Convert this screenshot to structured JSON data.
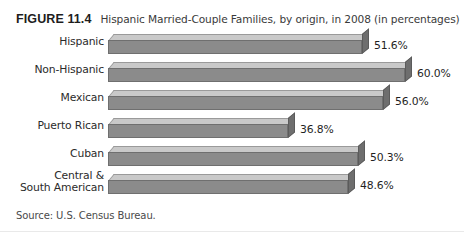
{
  "figure": {
    "number_label": "FIGURE 11.4",
    "title": "Hispanic Married-Couple Families, by origin, in 2008 (in percentages)",
    "source": "Source: U.S. Census Bureau."
  },
  "chart_data": {
    "type": "bar",
    "orientation": "horizontal",
    "style": "3d",
    "title": "Hispanic Married-Couple Families, by origin, in 2008 (in percentages)",
    "xlabel": "",
    "ylabel": "",
    "xlim": [
      0,
      65
    ],
    "grid": false,
    "legend": null,
    "categories": [
      "Hispanic",
      "Non-Hispanic",
      "Mexican",
      "Puerto Rican",
      "Cuban",
      "Central &\nSouth American"
    ],
    "values": [
      51.6,
      60.0,
      56.0,
      36.8,
      50.3,
      48.6
    ],
    "value_labels": [
      "51.6%",
      "60.0%",
      "56.0%",
      "36.8%",
      "50.3%",
      "48.6%"
    ],
    "colors": {
      "bar_front": "#8b8b8b",
      "bar_top": "#c9c9c9",
      "bar_side": "#6e6e6e",
      "background": "#ffffff",
      "text": "#2b2b2b"
    }
  },
  "rows": [
    {
      "label": "Hispanic",
      "label2": "",
      "value_label": "51.6%",
      "bar_px": 254
    },
    {
      "label": "Non-Hispanic",
      "label2": "",
      "value_label": "60.0%",
      "bar_px": 297
    },
    {
      "label": "Mexican",
      "label2": "",
      "value_label": "56.0%",
      "bar_px": 275
    },
    {
      "label": "Puerto Rican",
      "label2": "",
      "value_label": "36.8%",
      "bar_px": 180
    },
    {
      "label": "Cuban",
      "label2": "",
      "value_label": "50.3%",
      "bar_px": 250
    },
    {
      "label": "Central &",
      "label2": "South American",
      "value_label": "48.6%",
      "bar_px": 240
    }
  ]
}
